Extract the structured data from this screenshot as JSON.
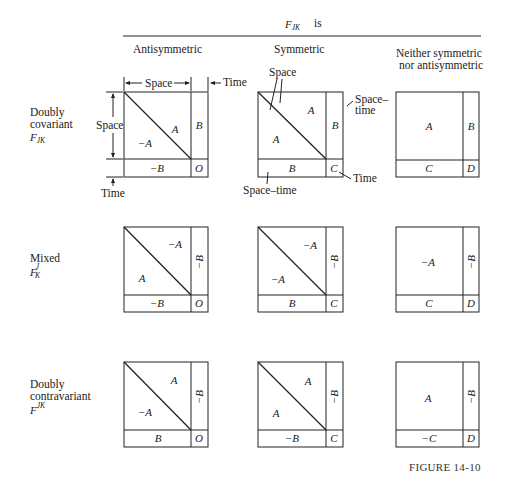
{
  "header": {
    "title_main": "F",
    "title_sub": "JK",
    "title_suffix": "is",
    "columns": [
      "Antisymmetric",
      "Symmetric",
      "Neither symmetric",
      "nor antisymmetric"
    ]
  },
  "rows": [
    {
      "label_line1": "Doubly",
      "label_line2": "covariant",
      "symbol": "F",
      "symbol_sub": "JK",
      "symbol_sup": ""
    },
    {
      "label_line1": "Mixed",
      "label_line2": "",
      "symbol": "F",
      "symbol_sub": "K",
      "symbol_sup": "J"
    },
    {
      "label_line1": "Doubly",
      "label_line2": "contravariant",
      "symbol": "F",
      "symbol_sub": "",
      "symbol_sup": "JK"
    }
  ],
  "cells": {
    "r1": {
      "anti": {
        "upper": "A",
        "lower": "−A",
        "side": "B",
        "bottom": "−B",
        "corner": "O"
      },
      "sym": {
        "upper": "A",
        "lower": "A",
        "side": "B",
        "bottom": "B",
        "corner": "C"
      },
      "neither": {
        "main": "A",
        "side": "B",
        "bottom": "C",
        "corner": "D"
      }
    },
    "r2": {
      "anti": {
        "upper": "−A",
        "lower": "A",
        "side": "−B",
        "bottom": "−B",
        "corner": "O"
      },
      "sym": {
        "upper": "−A",
        "lower": "−A",
        "side": "−B",
        "bottom": "B",
        "corner": "C"
      },
      "neither": {
        "main": "−A",
        "side": "−B",
        "bottom": "C",
        "corner": "D"
      }
    },
    "r3": {
      "anti": {
        "upper": "A",
        "lower": "−A",
        "side": "−B",
        "bottom": "B",
        "corner": "O"
      },
      "sym": {
        "upper": "A",
        "lower": "A",
        "side": "−B",
        "bottom": "−B",
        "corner": "C"
      },
      "neither": {
        "main": "A",
        "side": "−B",
        "bottom": "−C",
        "corner": "D"
      }
    }
  },
  "annotations": {
    "space_top": "Space",
    "time_top": "Time",
    "space_left": "Space",
    "time_bottom": "Time",
    "sym_space": "Space",
    "sym_spacetime_right_1": "Space–",
    "sym_spacetime_right_2": "time",
    "sym_spacetime_bottom": "Space–time",
    "sym_time": "Time"
  },
  "caption": "FIGURE 14-10"
}
